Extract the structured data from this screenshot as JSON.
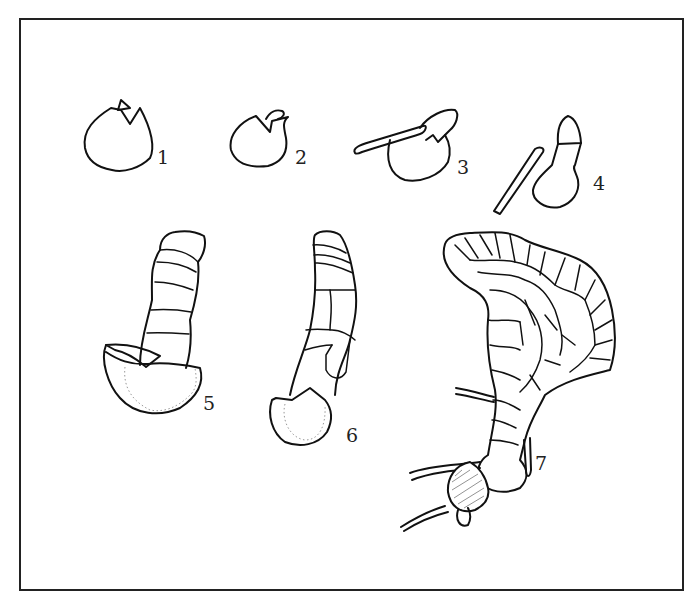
{
  "figure": {
    "stage_labels": [
      "1",
      "2",
      "3",
      "4",
      "5",
      "6",
      "7"
    ],
    "colors": {
      "line": "#111111",
      "background": "#ffffff",
      "frame": "#222222"
    }
  }
}
